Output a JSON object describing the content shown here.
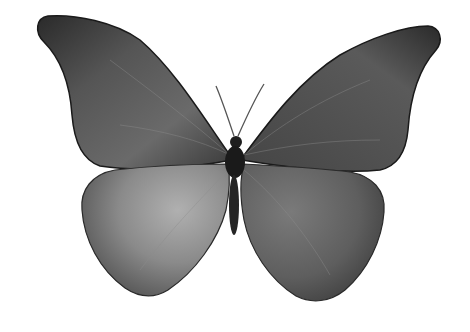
{
  "image": {
    "subject": "butterfly",
    "description": "Grayscale photograph of a butterfly with wings spread on a white background",
    "background_color": "#ffffff",
    "colors": {
      "forewing_dark": "#2e2e2e",
      "forewing_mid": "#5a5a5a",
      "hindwing_light": "#9a9a9a",
      "hindwing_mid": "#6a6a6a",
      "body": "#1e1e1e",
      "antenna": "#555555"
    }
  }
}
